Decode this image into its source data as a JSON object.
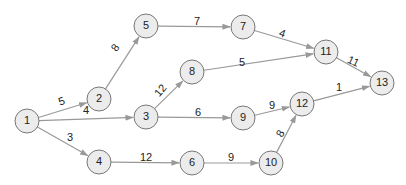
{
  "style": {
    "node_fill": "#ececec",
    "node_stroke": "#777777",
    "edge_color": "#999999",
    "text_color": "#222222",
    "node_radius": 12
  },
  "nodes": [
    {
      "id": "1",
      "label": "1",
      "x": 27,
      "y": 121
    },
    {
      "id": "2",
      "label": "2",
      "x": 99,
      "y": 99
    },
    {
      "id": "3",
      "label": "3",
      "x": 146,
      "y": 117
    },
    {
      "id": "4",
      "label": "4",
      "x": 99,
      "y": 162
    },
    {
      "id": "5",
      "label": "5",
      "x": 146,
      "y": 26
    },
    {
      "id": "6",
      "label": "6",
      "x": 192,
      "y": 163
    },
    {
      "id": "7",
      "label": "7",
      "x": 243,
      "y": 27
    },
    {
      "id": "8",
      "label": "8",
      "x": 192,
      "y": 72
    },
    {
      "id": "9",
      "label": "9",
      "x": 243,
      "y": 118
    },
    {
      "id": "10",
      "label": "10",
      "x": 271,
      "y": 163
    },
    {
      "id": "11",
      "label": "11",
      "x": 326,
      "y": 52
    },
    {
      "id": "12",
      "label": "12",
      "x": 302,
      "y": 104
    },
    {
      "id": "13",
      "label": "13",
      "x": 382,
      "y": 83
    }
  ],
  "edges": [
    {
      "from": "1",
      "to": "2",
      "weight": "5",
      "lx": 62,
      "ly": 102,
      "rot": -20
    },
    {
      "from": "1",
      "to": "3",
      "weight": "4",
      "lx": 86,
      "ly": 111,
      "rot": 0
    },
    {
      "from": "1",
      "to": "4",
      "weight": "3",
      "lx": 70,
      "ly": 138,
      "rot": 0
    },
    {
      "from": "2",
      "to": "5",
      "weight": "8",
      "lx": 116,
      "ly": 48,
      "rot": -55
    },
    {
      "from": "5",
      "to": "7",
      "weight": "7",
      "lx": 197,
      "ly": 22,
      "rot": 0
    },
    {
      "from": "3",
      "to": "8",
      "weight": "12",
      "lx": 161,
      "ly": 91,
      "rot": -50
    },
    {
      "from": "3",
      "to": "9",
      "weight": "6",
      "lx": 198,
      "ly": 113,
      "rot": 0
    },
    {
      "from": "4",
      "to": "6",
      "weight": "12",
      "lx": 146,
      "ly": 158,
      "rot": 0
    },
    {
      "from": "7",
      "to": "11",
      "weight": "4",
      "lx": 282,
      "ly": 34,
      "rot": 20
    },
    {
      "from": "8",
      "to": "11",
      "weight": "5",
      "lx": 242,
      "ly": 63,
      "rot": 0
    },
    {
      "from": "9",
      "to": "12",
      "weight": "9",
      "lx": 272,
      "ly": 106,
      "rot": 0
    },
    {
      "from": "6",
      "to": "10",
      "weight": "9",
      "lx": 231,
      "ly": 158,
      "rot": 0
    },
    {
      "from": "10",
      "to": "12",
      "weight": "8",
      "lx": 281,
      "ly": 134,
      "rot": -60
    },
    {
      "from": "11",
      "to": "13",
      "weight": "11",
      "lx": 353,
      "ly": 62,
      "rot": 25
    },
    {
      "from": "12",
      "to": "13",
      "weight": "1",
      "lx": 339,
      "ly": 88,
      "rot": 0
    }
  ]
}
